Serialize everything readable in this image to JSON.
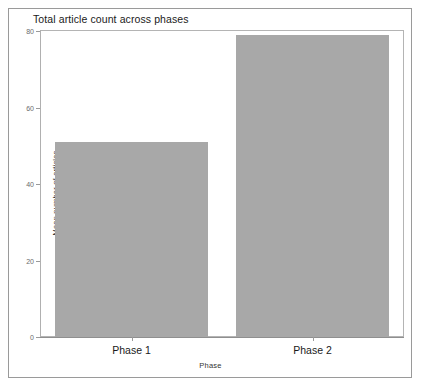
{
  "chart_data": {
    "type": "bar",
    "title": "Total article count across phases",
    "xlabel": "Phase",
    "ylabel": "Mean number of articles",
    "categories": [
      "Phase 1",
      "Phase 2"
    ],
    "values": [
      51,
      79
    ],
    "ylim": [
      0,
      80
    ],
    "yticks": [
      0,
      20,
      40,
      60,
      80
    ],
    "ytick_labels": [
      "0",
      "20",
      "40",
      "60",
      "80"
    ],
    "grid": false,
    "legend": null,
    "bar_color": "#a8a8a8",
    "background_color": "#ffffff",
    "frame_color": "#b4b4b4",
    "axis_color": "#9a9a9a"
  },
  "window": {
    "border_color": "#9a9a9a"
  }
}
